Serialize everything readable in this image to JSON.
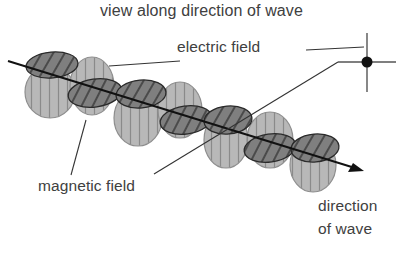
{
  "diagram": {
    "title": "view along direction of wave",
    "labels": {
      "electric_field": "electric field",
      "magnetic_field": "magnetic field",
      "direction_line1": "direction",
      "direction_line2": "of wave"
    },
    "colors": {
      "electric_lobe_fill": "#b4b4b4",
      "magnetic_lobe_fill": "#7e7e7e",
      "outline": "#2a2a2a",
      "axis": "#111111",
      "text": "#404040"
    },
    "components": [
      "electric field (vertical-striped lobes)",
      "magnetic field (diagonal-hatched lobes)",
      "propagation axis with arrow",
      "end-on view cross symbol"
    ]
  }
}
